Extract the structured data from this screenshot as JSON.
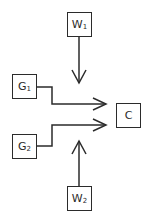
{
  "diagram": {
    "type": "flow",
    "nodes": [
      {
        "id": "W1",
        "label": "W",
        "subscript": "1"
      },
      {
        "id": "G1",
        "label": "G",
        "subscript": "1"
      },
      {
        "id": "C",
        "label": "C",
        "subscript": ""
      },
      {
        "id": "G2",
        "label": "G",
        "subscript": "2"
      },
      {
        "id": "W2",
        "label": "W",
        "subscript": "2"
      }
    ],
    "edges": [
      {
        "from": "W1",
        "to": "C",
        "direction": "down"
      },
      {
        "from": "G1",
        "to": "C",
        "direction": "right"
      },
      {
        "from": "G2",
        "to": "C",
        "direction": "right"
      },
      {
        "from": "W2",
        "to": "C",
        "direction": "up"
      }
    ],
    "colors": {
      "stroke": "#2b2b2b",
      "background": "#ffffff"
    }
  }
}
